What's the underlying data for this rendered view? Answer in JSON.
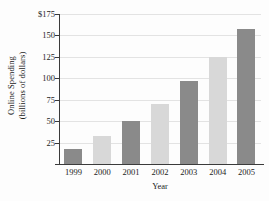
{
  "chart_data": {
    "type": "bar",
    "title": "",
    "xlabel": "Year",
    "ylabel_line1": "Online Spending",
    "ylabel_line2": "(billions of dollars)",
    "categories": [
      "1999",
      "2000",
      "2001",
      "2002",
      "2003",
      "2004",
      "2005"
    ],
    "values": [
      17,
      33,
      50,
      70,
      97,
      125,
      157
    ],
    "ytick_labels": [
      "25",
      "50",
      "75",
      "100",
      "125",
      "150",
      "$175"
    ],
    "ytick_values": [
      25,
      50,
      75,
      100,
      125,
      150,
      175
    ],
    "ylim": [
      0,
      175
    ],
    "grid": true,
    "legend": "none",
    "bar_colors": [
      "#8a8a8a",
      "#d8d8d8",
      "#8a8a8a",
      "#d8d8d8",
      "#8a8a8a",
      "#d8d8d8",
      "#8a8a8a"
    ],
    "colors": {
      "bar_dark": "#8a8a8a",
      "bar_light": "#d8d8d8",
      "gridline": "#e3e3e3",
      "axis": "#3b3b3b",
      "text": "#1c1c1c",
      "background": "#fdfdfd"
    }
  }
}
